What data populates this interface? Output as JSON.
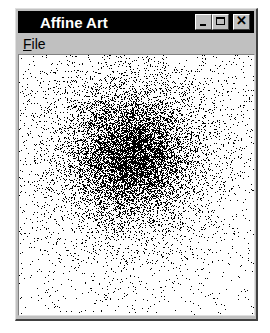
{
  "window": {
    "title": "Affine Art",
    "controls": {
      "minimize": "minimize-icon",
      "maximize": "maximize-icon",
      "close": "close-icon"
    }
  },
  "menubar": {
    "items": [
      {
        "label": "File",
        "mnemonic": "F",
        "rest": "ile"
      }
    ]
  },
  "canvas": {
    "background": "#ffffff",
    "point_color": "#000000",
    "description": "Dense scatter of black points forming a dark blob centered upper-middle, fading outward",
    "center_x": 112,
    "center_y": 100,
    "spread": 38,
    "points": 26000,
    "uniform_noise_points": 900
  },
  "colors": {
    "titlebar": "#000000",
    "face": "#c0c0c0",
    "title_text": "#ffffff"
  }
}
